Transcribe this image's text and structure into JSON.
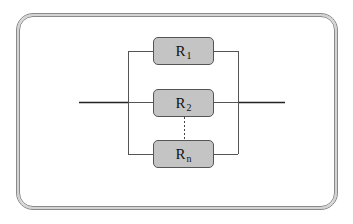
{
  "diagram": {
    "resistors": [
      {
        "label": "R",
        "subscript": "1"
      },
      {
        "label": "R",
        "subscript": "2"
      },
      {
        "label": "R",
        "subscript": "n"
      }
    ],
    "colors": {
      "resistor_fill": "#c4c4c4",
      "resistor_border": "#555555",
      "wire": "#333333",
      "frame": "#8a8a8a"
    }
  }
}
